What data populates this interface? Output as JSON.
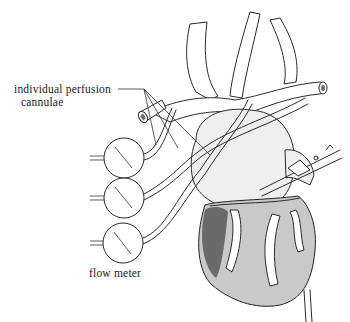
{
  "figure": {
    "labels": {
      "cannulae_line1": "individual perfusion",
      "cannulae_line2": "cannulae",
      "flow_meter": "flow meter"
    },
    "flow_meters": [
      {
        "id": 1
      },
      {
        "id": 2
      },
      {
        "id": 3
      }
    ],
    "colors": {
      "line": "#2a2a2a",
      "heart_shade": "#c9c9c9",
      "atrium_shade": "#efefef",
      "background": "#ffffff"
    }
  }
}
